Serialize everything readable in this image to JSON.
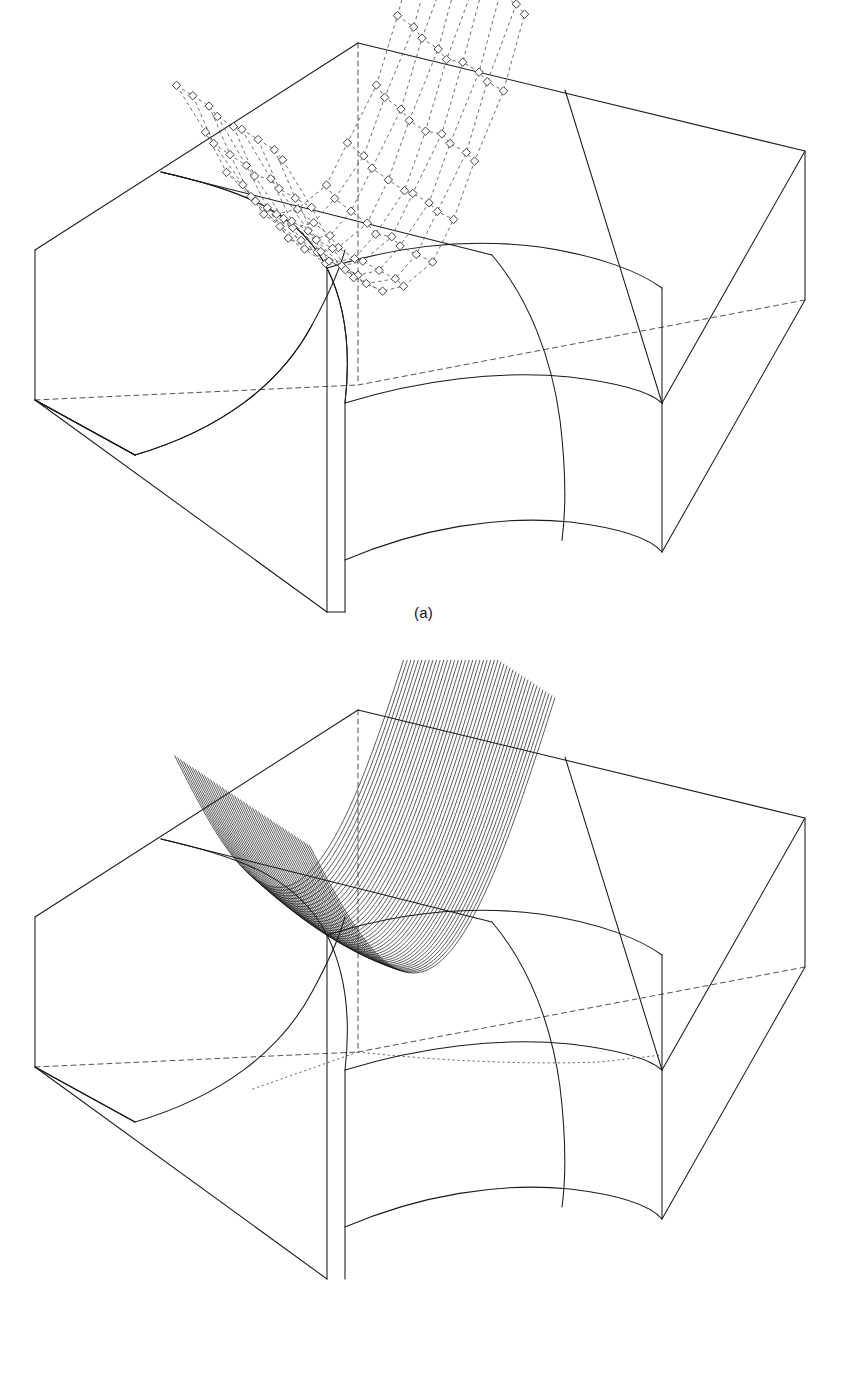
{
  "document": {
    "kind": "technical-line-figure",
    "background_color": "#ffffff",
    "line_color": "#1a1a1a",
    "subfigure_count": 2
  },
  "figures": [
    {
      "id": "a",
      "caption": "(a)",
      "description": "Rectangular solid block with a curved groove cut in the top face, shown with its B-spline control polyhedron: diamond control-point markers joined by dashed control-net lines.",
      "marker_shape": "diamond",
      "net_style": "dashed",
      "edge_style": "solid",
      "hidden_edge_style": "dashed",
      "control_rows": 9,
      "control_cols": 11,
      "control_point_count": 99
    },
    {
      "id": "b",
      "caption": "(b)",
      "description": "The same block rendered as the evaluated surface, with a dense family of isoparametric contour lines sweeping across the curved groove.",
      "contour_count": 46,
      "edge_style": "solid",
      "hidden_edge_style": "dashed",
      "contour_style": "solid"
    }
  ],
  "geometry": {
    "block_label": "rectangular-block",
    "feature_label": "cylindrical-groove",
    "patch_boundaries": 3,
    "view": "isometric-oblique"
  },
  "colors": {
    "stroke": "#1a1a1a",
    "light_stroke": "#555555",
    "marker_fill": "#ffffff",
    "paper": "#ffffff"
  }
}
